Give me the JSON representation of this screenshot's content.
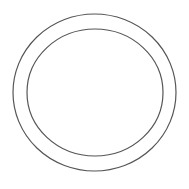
{
  "canvas": {
    "width": 189,
    "height": 189,
    "background": "#ffffff"
  },
  "shapes": {
    "outer_ring": {
      "cx": 94.5,
      "cy": 92.5,
      "rx": 81.5,
      "ry": 78.5,
      "stroke": "#555555",
      "stroke_width": 1.2
    },
    "inner_ring": {
      "cx": 95,
      "cy": 92.5,
      "rx": 68,
      "ry": 63.5,
      "stroke": "#555555",
      "stroke_width": 1.2
    }
  }
}
